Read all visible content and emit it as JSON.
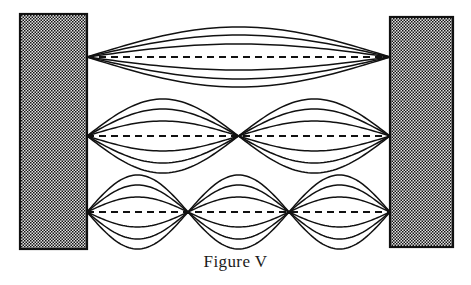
{
  "figure": {
    "caption": "Figure V",
    "background_color": "#ffffff",
    "line_color": "#111111",
    "wall_fill_color": "#d9d9d9",
    "wall_border_color": "#111111",
    "canvas": {
      "width": 471,
      "height": 285
    }
  },
  "walls": [
    {
      "name": "left-wall",
      "x": 20,
      "y": 14,
      "width": 67,
      "height": 235,
      "pattern": "stipple-dots"
    },
    {
      "name": "right-wall",
      "x": 390,
      "y": 17,
      "width": 63,
      "height": 230,
      "pattern": "stipple-dots"
    }
  ],
  "string": {
    "x_start": 87,
    "x_end": 390,
    "length": 303
  },
  "chart_data": {
    "type": "line",
    "title": "Figure V",
    "xlabel": "",
    "ylabel": "",
    "grid": false,
    "legend": false,
    "xlim": [
      87,
      390
    ],
    "series": [
      {
        "name": "fundamental",
        "harmonic": 1,
        "loops": 1,
        "axis_y": 57,
        "node_positions": [
          87,
          390
        ],
        "antinode_positions": [
          238.5
        ],
        "amplitudes": [
          30,
          22,
          13
        ],
        "curve_count": 6,
        "dashed_axis": true
      },
      {
        "name": "second-harmonic",
        "harmonic": 2,
        "loops": 2,
        "axis_y": 136,
        "node_positions": [
          87,
          238.5,
          390
        ],
        "antinode_positions": [
          162.75,
          314.25
        ],
        "amplitudes": [
          37,
          27,
          15
        ],
        "curve_count": 6,
        "dashed_axis": true
      },
      {
        "name": "third-harmonic",
        "harmonic": 3,
        "loops": 3,
        "axis_y": 212,
        "node_positions": [
          87,
          188,
          289,
          390
        ],
        "antinode_positions": [
          137.5,
          238.5,
          339.5
        ],
        "amplitudes": [
          37,
          27,
          15
        ],
        "curve_count": 6,
        "dashed_axis": true
      }
    ]
  }
}
